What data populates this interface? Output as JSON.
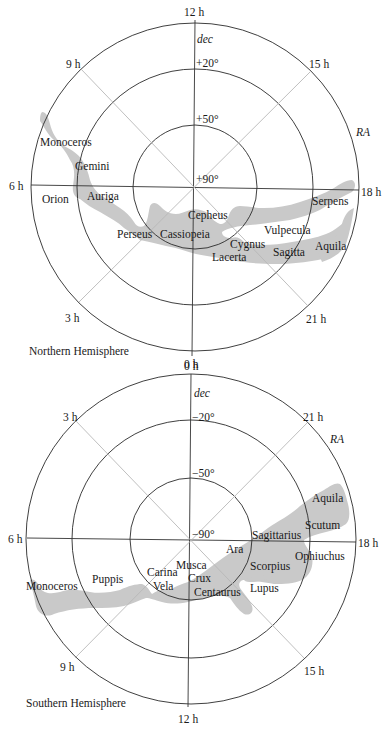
{
  "north": {
    "title": "Northern Hemisphere",
    "hours": {
      "top": "12 h",
      "upper_left": "9 h",
      "upper_right": "15 h",
      "left": "6 h",
      "right": "18 h",
      "lower_left": "3 h",
      "lower_right": "21 h",
      "bottom": "0 h"
    },
    "axis_labels": {
      "dec": "dec",
      "ra": "RA"
    },
    "dec_rings": [
      "+20°",
      "+50°",
      "+90°"
    ],
    "constellations": {
      "monoceros": "Monoceros",
      "gemini": "Gemini",
      "orion": "Orion",
      "auriga": "Auriga",
      "perseus": "Perseus",
      "cassiopeia": "Cassiopeia",
      "cepheus": "Cepheus",
      "cygnus": "Cygnus",
      "lacerta": "Lacerta",
      "vulpecula": "Vulpecula",
      "sagitta": "Sagitta",
      "aquila": "Aquila",
      "serpens": "Serpens"
    }
  },
  "south": {
    "title": "Southern Hemisphere",
    "hours": {
      "top": "0 h",
      "upper_left": "3 h",
      "upper_right": "21 h",
      "left": "6 h",
      "right": "18 h",
      "lower_left": "9 h",
      "lower_right": "15 h",
      "bottom": "12 h"
    },
    "axis_labels": {
      "dec": "dec",
      "ra": "RA"
    },
    "dec_rings": [
      "−20°",
      "−50°",
      "−90°"
    ],
    "constellations": {
      "aquila": "Aquila",
      "scutum": "Scutum",
      "sagittarius": "Sagittarius",
      "ophiuchus": "Ophiuchus",
      "ara": "Ara",
      "scorpius": "Scorpius",
      "lupus": "Lupus",
      "musca": "Musca",
      "crux": "Crux",
      "centaurus": "Centaurus",
      "carina": "Carina",
      "vela": "Vela",
      "puppis": "Puppis",
      "monoceros": "Monoceros"
    }
  },
  "colors": {
    "milky_way": "#c9c9c9",
    "lines": "#2a2a2a",
    "diagonals": "#b8b8b8"
  }
}
